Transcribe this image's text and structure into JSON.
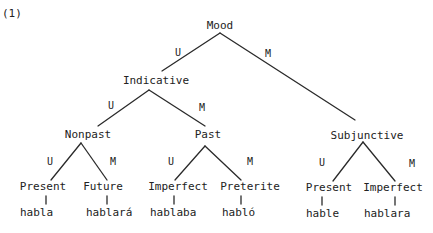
{
  "example_number": "(1)",
  "tree": {
    "root": "Mood",
    "branch_labels": {
      "unmarked": "U",
      "marked": "M"
    },
    "nodes": {
      "mood": "Mood",
      "indicative": "Indicative",
      "subjunctive": "Subjunctive",
      "nonpast": "Nonpast",
      "past": "Past",
      "present_ind": "Present",
      "future": "Future",
      "imperfect_ind": "Imperfect",
      "preterite": "Preterite",
      "present_subj": "Present",
      "imperfect_subj": "Imperfect"
    },
    "forms": {
      "present_ind": "habla",
      "future": "hablará",
      "imperfect_ind": "hablaba",
      "preterite": "habló",
      "present_subj": "hable",
      "imperfect_subj": "hablara"
    },
    "edges": [
      {
        "from": "Mood",
        "to": "Indicative",
        "label": "U"
      },
      {
        "from": "Mood",
        "to": "Subjunctive",
        "label": "M"
      },
      {
        "from": "Indicative",
        "to": "Nonpast",
        "label": "U"
      },
      {
        "from": "Indicative",
        "to": "Past",
        "label": "M"
      },
      {
        "from": "Nonpast",
        "to": "Present",
        "label": "U"
      },
      {
        "from": "Nonpast",
        "to": "Future",
        "label": "M"
      },
      {
        "from": "Past",
        "to": "Imperfect",
        "label": "U"
      },
      {
        "from": "Past",
        "to": "Preterite",
        "label": "M"
      },
      {
        "from": "Subjunctive",
        "to": "Present",
        "label": "U"
      },
      {
        "from": "Subjunctive",
        "to": "Imperfect",
        "label": "M"
      }
    ]
  }
}
